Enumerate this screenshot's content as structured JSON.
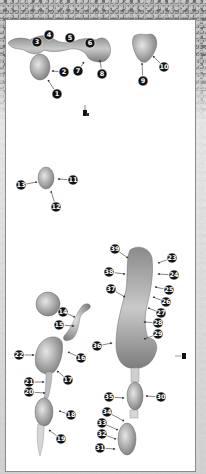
{
  "diagram": {
    "title": "",
    "callouts": [
      {
        "id": "c1",
        "label": "1",
        "x": 57,
        "y": 94,
        "tx": 48,
        "ty": 80
      },
      {
        "id": "c2",
        "label": "2",
        "x": 64,
        "y": 72,
        "tx": 52,
        "ty": 71
      },
      {
        "id": "c3",
        "label": "3",
        "x": 37,
        "y": 42,
        "tx": 37,
        "ty": 42
      },
      {
        "id": "c4",
        "label": "4",
        "x": 49,
        "y": 35,
        "tx": 49,
        "ty": 35
      },
      {
        "id": "c5",
        "label": "5",
        "x": 70,
        "y": 38,
        "tx": 70,
        "ty": 38
      },
      {
        "id": "c6",
        "label": "6",
        "x": 90,
        "y": 43,
        "tx": 90,
        "ty": 43
      },
      {
        "id": "c7",
        "label": "7",
        "x": 78,
        "y": 71,
        "tx": 84,
        "ty": 62
      },
      {
        "id": "c8",
        "label": "8",
        "x": 102,
        "y": 74,
        "tx": 100,
        "ty": 60
      },
      {
        "id": "c9",
        "label": "9",
        "x": 143,
        "y": 81,
        "tx": 142,
        "ty": 63
      },
      {
        "id": "c10",
        "label": "10",
        "x": 164,
        "y": 67,
        "tx": 153,
        "ty": 56
      },
      {
        "id": "c11",
        "label": "11",
        "x": 73,
        "y": 180,
        "tx": 58,
        "ty": 179
      },
      {
        "id": "c12",
        "label": "12",
        "x": 56,
        "y": 207,
        "tx": 51,
        "ty": 191
      },
      {
        "id": "c13",
        "label": "13",
        "x": 21,
        "y": 185,
        "tx": 37,
        "ty": 182
      },
      {
        "id": "c14",
        "label": "14",
        "x": 63,
        "y": 312,
        "tx": 75,
        "ty": 317
      },
      {
        "id": "c15",
        "label": "15",
        "x": 59,
        "y": 325,
        "tx": 74,
        "ty": 326
      },
      {
        "id": "c16",
        "label": "16",
        "x": 81,
        "y": 358,
        "tx": 68,
        "ty": 352
      },
      {
        "id": "c17",
        "label": "17",
        "x": 68,
        "y": 380,
        "tx": 57,
        "ty": 371
      },
      {
        "id": "c18",
        "label": "18",
        "x": 71,
        "y": 415,
        "tx": 59,
        "ty": 411
      },
      {
        "id": "c19",
        "label": "19",
        "x": 61,
        "y": 439,
        "tx": 49,
        "ty": 430
      },
      {
        "id": "c20",
        "label": "20",
        "x": 29,
        "y": 392,
        "tx": 45,
        "ty": 393
      },
      {
        "id": "c21",
        "label": "21",
        "x": 29,
        "y": 382,
        "tx": 44,
        "ty": 382
      },
      {
        "id": "c22",
        "label": "22",
        "x": 19,
        "y": 355,
        "tx": 34,
        "ty": 355
      },
      {
        "id": "c23",
        "label": "23",
        "x": 172,
        "y": 258,
        "tx": 158,
        "ty": 263
      },
      {
        "id": "c24",
        "label": "24",
        "x": 174,
        "y": 275,
        "tx": 158,
        "ty": 274
      },
      {
        "id": "c25",
        "label": "25",
        "x": 169,
        "y": 290,
        "tx": 155,
        "ty": 287
      },
      {
        "id": "c26",
        "label": "26",
        "x": 166,
        "y": 302,
        "tx": 153,
        "ty": 297
      },
      {
        "id": "c27",
        "label": "27",
        "x": 161,
        "y": 313,
        "tx": 148,
        "ty": 308
      },
      {
        "id": "c28",
        "label": "28",
        "x": 158,
        "y": 323,
        "tx": 144,
        "ty": 322
      },
      {
        "id": "c29",
        "label": "29",
        "x": 158,
        "y": 334,
        "tx": 144,
        "ty": 339
      },
      {
        "id": "c30",
        "label": "30",
        "x": 161,
        "y": 397,
        "tx": 146,
        "ty": 396
      },
      {
        "id": "c31",
        "label": "31",
        "x": 100,
        "y": 448,
        "tx": 115,
        "ty": 449
      },
      {
        "id": "c32",
        "label": "32",
        "x": 102,
        "y": 434,
        "tx": 116,
        "ty": 439
      },
      {
        "id": "c33",
        "label": "33",
        "x": 102,
        "y": 423,
        "tx": 118,
        "ty": 430
      },
      {
        "id": "c34",
        "label": "34",
        "x": 107,
        "y": 412,
        "tx": 124,
        "ty": 421
      },
      {
        "id": "c35",
        "label": "35",
        "x": 109,
        "y": 397,
        "tx": 124,
        "ty": 398
      },
      {
        "id": "c36",
        "label": "36",
        "x": 97,
        "y": 346,
        "tx": 112,
        "ty": 343
      },
      {
        "id": "c37",
        "label": "37",
        "x": 111,
        "y": 289,
        "tx": 125,
        "ty": 297
      },
      {
        "id": "c38",
        "label": "38",
        "x": 109,
        "y": 272,
        "tx": 125,
        "ty": 274
      },
      {
        "id": "c39",
        "label": "39",
        "x": 115,
        "y": 249,
        "tx": 128,
        "ty": 258
      }
    ],
    "colors": {
      "shape_fill_light": "#d8d8d8",
      "shape_fill_dark": "#7a7a7a",
      "callout_fill": "#111111",
      "callout_text": "#ffffff",
      "arrow": "#333333",
      "panel": "#ffffff"
    }
  }
}
